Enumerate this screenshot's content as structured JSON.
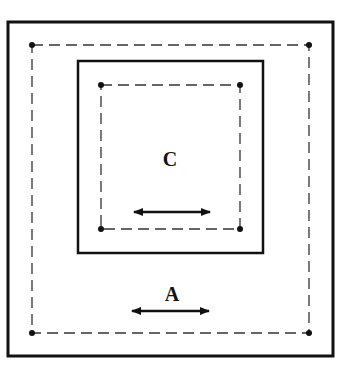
{
  "diagram": {
    "labels": {
      "inner": "C",
      "outer": "A"
    },
    "colors": {
      "stroke": "#111111",
      "dash": "#333333",
      "background": "#ffffff"
    },
    "outer_rect": {
      "x": 8,
      "y": 22,
      "w": 325,
      "h": 334
    },
    "outer_dashed": {
      "x": 32,
      "y": 45,
      "w": 277,
      "h": 288
    },
    "inner_rect": {
      "x": 78,
      "y": 61,
      "w": 185,
      "h": 192
    },
    "inner_dashed": {
      "x": 101,
      "y": 85,
      "w": 139,
      "h": 144
    },
    "inner_arrow": {
      "x1": 133,
      "x2": 211,
      "y": 212
    },
    "outer_arrow": {
      "x1": 131,
      "x2": 210,
      "y": 311
    }
  }
}
